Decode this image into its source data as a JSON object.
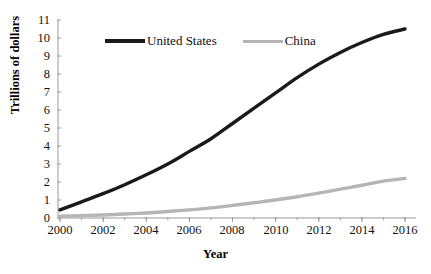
{
  "chart_data": {
    "type": "line",
    "title": "",
    "xlabel": "Year",
    "ylabel": "Trillions of dollars",
    "x": [
      2000,
      2001,
      2002,
      2003,
      2004,
      2005,
      2006,
      2007,
      2008,
      2009,
      2010,
      2011,
      2012,
      2013,
      2014,
      2015,
      2016
    ],
    "xticks": [
      "2000",
      "2002",
      "2004",
      "2006",
      "2008",
      "2010",
      "2012",
      "2014",
      "2016"
    ],
    "yticks": [
      "0",
      "1",
      "2",
      "3",
      "4",
      "5",
      "6",
      "7",
      "8",
      "9",
      "10",
      "11"
    ],
    "xlim": [
      2000,
      2016
    ],
    "ylim": [
      0,
      11
    ],
    "grid": false,
    "legend_position": "top-center",
    "series": [
      {
        "name": "United States",
        "color": "#1a1a1a",
        "values": [
          0.45,
          0.9,
          1.35,
          1.85,
          2.4,
          3.0,
          3.7,
          4.4,
          5.25,
          6.1,
          6.95,
          7.8,
          8.55,
          9.2,
          9.75,
          10.2,
          10.5
        ]
      },
      {
        "name": "China",
        "color": "#b5b5b5",
        "values": [
          0.1,
          0.13,
          0.17,
          0.22,
          0.28,
          0.36,
          0.45,
          0.56,
          0.7,
          0.85,
          1.0,
          1.18,
          1.38,
          1.6,
          1.82,
          2.05,
          2.2
        ]
      }
    ]
  },
  "legend": {
    "united_states": "United States",
    "china": "China"
  },
  "axis": {
    "y_title": "Trillions of dollars",
    "x_title": "Year",
    "y_tick_0": "0",
    "y_tick_1": "1",
    "y_tick_2": "2",
    "y_tick_3": "3",
    "y_tick_4": "4",
    "y_tick_5": "5",
    "y_tick_6": "6",
    "y_tick_7": "7",
    "y_tick_8": "8",
    "y_tick_9": "9",
    "y_tick_10": "10",
    "y_tick_11": "11",
    "x_tick_2000": "2000",
    "x_tick_2002": "2002",
    "x_tick_2004": "2004",
    "x_tick_2006": "2006",
    "x_tick_2008": "2008",
    "x_tick_2010": "2010",
    "x_tick_2012": "2012",
    "x_tick_2014": "2014",
    "x_tick_2016": "2016"
  },
  "colors": {
    "united_states_line": "#1a1a1a",
    "china_line": "#b5b5b5",
    "axis": "#9a9a9a",
    "text": "#111111",
    "background": "#ffffff"
  }
}
